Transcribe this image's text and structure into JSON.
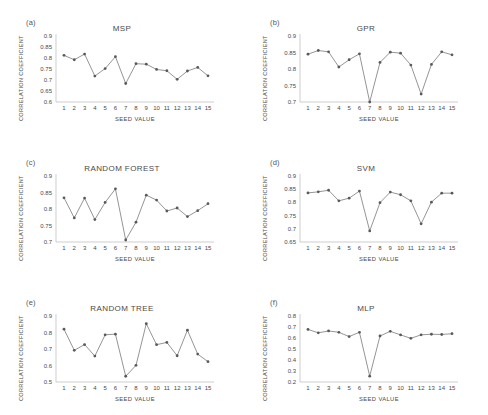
{
  "figure": {
    "axis_color": "#b9b9b9",
    "line_color": "#7a7a7a",
    "marker_color": "#595959",
    "text_color": "#4a4a4a"
  },
  "panels": [
    {
      "label": "(a)",
      "chart_data": {
        "type": "line",
        "title": "MSP",
        "xlabel": "SEED VALUE",
        "ylabel": "CORRELATION COEFFICIENT",
        "x": [
          1,
          2,
          3,
          4,
          5,
          6,
          7,
          8,
          9,
          10,
          11,
          12,
          13,
          14,
          15
        ],
        "categories": [
          "1",
          "2",
          "3",
          "4",
          "5",
          "6",
          "7",
          "8",
          "9",
          "10",
          "11",
          "12",
          "13",
          "14",
          "15"
        ],
        "values": [
          0.812,
          0.792,
          0.818,
          0.718,
          0.752,
          0.806,
          0.684,
          0.774,
          0.772,
          0.748,
          0.742,
          0.703,
          0.741,
          0.757,
          0.719
        ],
        "ylim": [
          0.6,
          0.9
        ],
        "yticks": [
          0.6,
          0.65,
          0.7,
          0.75,
          0.8,
          0.85,
          0.9
        ],
        "ytick_labels": [
          "0.6",
          "0.65",
          "0.7",
          "0.75",
          "0.8",
          "0.85",
          "0.9"
        ],
        "grid": false,
        "legend": null
      }
    },
    {
      "label": "(b)",
      "chart_data": {
        "type": "line",
        "title": "GPR",
        "xlabel": "SEED VALUE",
        "ylabel": "CORRELATION COEFFICIENT",
        "x": [
          1,
          2,
          3,
          4,
          5,
          6,
          7,
          8,
          9,
          10,
          11,
          12,
          13,
          14,
          15
        ],
        "categories": [
          "1",
          "2",
          "3",
          "4",
          "5",
          "6",
          "7",
          "8",
          "9",
          "10",
          "11",
          "12",
          "13",
          "14",
          "15"
        ],
        "values": [
          0.845,
          0.856,
          0.852,
          0.806,
          0.828,
          0.846,
          0.7,
          0.82,
          0.851,
          0.848,
          0.812,
          0.724,
          0.814,
          0.852,
          0.843
        ],
        "ylim": [
          0.7,
          0.9
        ],
        "yticks": [
          0.7,
          0.75,
          0.8,
          0.85,
          0.9
        ],
        "ytick_labels": [
          "0.7",
          "0.75",
          "0.8",
          "0.85",
          "0.9"
        ],
        "grid": false,
        "legend": null
      }
    },
    {
      "label": "(c)",
      "chart_data": {
        "type": "line",
        "title": "RANDOM FOREST",
        "xlabel": "SEED VALUE",
        "ylabel": "CORRELATION COEFFICIENT",
        "x": [
          1,
          2,
          3,
          4,
          5,
          6,
          7,
          8,
          9,
          10,
          11,
          12,
          13,
          14,
          15
        ],
        "categories": [
          "1",
          "2",
          "3",
          "4",
          "5",
          "6",
          "7",
          "8",
          "9",
          "10",
          "11",
          "12",
          "13",
          "14",
          "15"
        ],
        "values": [
          0.834,
          0.773,
          0.833,
          0.768,
          0.82,
          0.861,
          0.706,
          0.76,
          0.842,
          0.827,
          0.794,
          0.803,
          0.777,
          0.795,
          0.816
        ],
        "ylim": [
          0.7,
          0.9
        ],
        "yticks": [
          0.7,
          0.75,
          0.8,
          0.85,
          0.9
        ],
        "ytick_labels": [
          "0.7",
          "0.75",
          "0.8",
          "0.85",
          "0.9"
        ],
        "grid": false,
        "legend": null
      }
    },
    {
      "label": "(d)",
      "chart_data": {
        "type": "line",
        "title": "SVM",
        "xlabel": "SEED VALUE",
        "ylabel": "CORRELATION COEFFICIENT",
        "x": [
          1,
          2,
          3,
          4,
          5,
          6,
          7,
          8,
          9,
          10,
          11,
          12,
          13,
          14,
          15
        ],
        "categories": [
          "1",
          "2",
          "3",
          "4",
          "5",
          "6",
          "7",
          "8",
          "9",
          "10",
          "11",
          "12",
          "13",
          "14",
          "15"
        ],
        "values": [
          0.836,
          0.84,
          0.846,
          0.806,
          0.816,
          0.843,
          0.692,
          0.799,
          0.839,
          0.829,
          0.806,
          0.719,
          0.801,
          0.835,
          0.835
        ],
        "ylim": [
          0.65,
          0.9
        ],
        "yticks": [
          0.65,
          0.7,
          0.75,
          0.8,
          0.85,
          0.9
        ],
        "ytick_labels": [
          "0.65",
          "0.7",
          "0.75",
          "0.8",
          "0.85",
          "0.9"
        ],
        "grid": false,
        "legend": null
      }
    },
    {
      "label": "(e)",
      "chart_data": {
        "type": "line",
        "title": "RANDOM TREE",
        "xlabel": "SEED VALUE",
        "ylabel": "CORRELATION COEFFICIENT",
        "x": [
          1,
          2,
          3,
          4,
          5,
          6,
          7,
          8,
          9,
          10,
          11,
          12,
          13,
          14,
          15
        ],
        "categories": [
          "1",
          "2",
          "3",
          "4",
          "5",
          "6",
          "7",
          "8",
          "9",
          "10",
          "11",
          "12",
          "13",
          "14",
          "15"
        ],
        "values": [
          0.82,
          0.692,
          0.727,
          0.657,
          0.786,
          0.79,
          0.535,
          0.601,
          0.853,
          0.726,
          0.74,
          0.659,
          0.814,
          0.669,
          0.623
        ],
        "ylim": [
          0.5,
          0.9
        ],
        "yticks": [
          0.5,
          0.6,
          0.7,
          0.8,
          0.9
        ],
        "ytick_labels": [
          "0.5",
          "0.6",
          "0.7",
          "0.8",
          "0.9"
        ],
        "grid": false,
        "legend": null
      }
    },
    {
      "label": "(f)",
      "chart_data": {
        "type": "line",
        "title": "MLP",
        "xlabel": "SEED VALUE",
        "ylabel": "CORRELATION COEFFICIENT",
        "x": [
          1,
          2,
          3,
          4,
          5,
          6,
          7,
          8,
          9,
          10,
          11,
          12,
          13,
          14,
          15
        ],
        "categories": [
          "1",
          "2",
          "3",
          "4",
          "5",
          "6",
          "7",
          "8",
          "9",
          "10",
          "11",
          "12",
          "13",
          "14",
          "15"
        ],
        "values": [
          0.678,
          0.647,
          0.664,
          0.652,
          0.613,
          0.652,
          0.253,
          0.618,
          0.661,
          0.628,
          0.597,
          0.629,
          0.634,
          0.632,
          0.639
        ],
        "ylim": [
          0.2,
          0.8
        ],
        "yticks": [
          0.2,
          0.3,
          0.4,
          0.5,
          0.6,
          0.7,
          0.8
        ],
        "ytick_labels": [
          "0.2",
          "0.3",
          "0.4",
          "0.5",
          "0.6",
          "0.7",
          "0.8"
        ],
        "grid": false,
        "legend": null
      }
    }
  ]
}
